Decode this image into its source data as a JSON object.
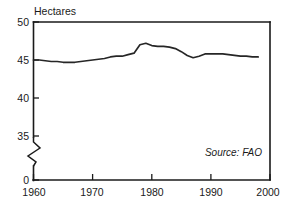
{
  "chart_data": {
    "type": "line",
    "title": "",
    "ylabel": "Hectares",
    "xlabel": "",
    "ylim": [
      0,
      50
    ],
    "y_break": {
      "from": 0,
      "to": 35,
      "present": true
    },
    "yticks": [
      50,
      45,
      40,
      35,
      0
    ],
    "ytick_labels": [
      "50",
      "45",
      "40",
      "35",
      "0"
    ],
    "xlim": [
      1960,
      2000
    ],
    "xticks": [
      1960,
      1970,
      1980,
      1990,
      2000
    ],
    "xtick_labels": [
      "1960",
      "1970",
      "1980",
      "1990",
      "2000"
    ],
    "grid": false,
    "legend": null,
    "annotations": [
      {
        "text": "Source: FAO",
        "position": "bottom-right",
        "style": "italic"
      }
    ],
    "series": [
      {
        "name": "Hectares",
        "color": "#262626",
        "x": [
          1960,
          1961,
          1962,
          1963,
          1964,
          1965,
          1966,
          1967,
          1968,
          1969,
          1970,
          1971,
          1972,
          1973,
          1974,
          1975,
          1976,
          1977,
          1978,
          1979,
          1980,
          1981,
          1982,
          1983,
          1984,
          1985,
          1986,
          1987,
          1988,
          1989,
          1990,
          1991,
          1992,
          1993,
          1994,
          1995,
          1996,
          1997,
          1998
        ],
        "values": [
          45.0,
          45.0,
          44.9,
          44.8,
          44.8,
          44.7,
          44.7,
          44.7,
          44.8,
          44.9,
          45.0,
          45.1,
          45.2,
          45.4,
          45.5,
          45.5,
          45.7,
          45.9,
          47.0,
          47.2,
          46.9,
          46.8,
          46.8,
          46.7,
          46.5,
          46.1,
          45.6,
          45.3,
          45.5,
          45.8,
          45.8,
          45.8,
          45.8,
          45.7,
          45.6,
          45.5,
          45.5,
          45.4,
          45.4
        ]
      }
    ]
  },
  "axis_title_text": "Hectares",
  "source_text": "Source: FAO"
}
